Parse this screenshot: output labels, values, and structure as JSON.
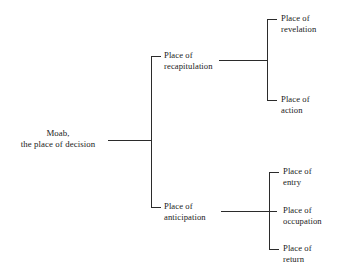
{
  "diagram": {
    "type": "tree-bracket-diagram",
    "orientation": "left-to-right",
    "line_color": "#2b2b2b",
    "background_color": "#ffffff",
    "text_color": "#1a1a1a",
    "root": {
      "id": "root",
      "line1": "Moab,",
      "line2": "the place of decision"
    },
    "branches": [
      {
        "id": "recapitulation",
        "line1": "Place of",
        "line2": "recapitulation",
        "children": [
          {
            "id": "revelation",
            "line1": "Place of",
            "line2": "revelation"
          },
          {
            "id": "action",
            "line1": "Place of",
            "line2": "action"
          }
        ]
      },
      {
        "id": "anticipation",
        "line1": "Place of",
        "line2": "anticipation",
        "children": [
          {
            "id": "entry",
            "line1": "Place of",
            "line2": "entry"
          },
          {
            "id": "occupation",
            "line1": "Place of",
            "line2": "occupation"
          },
          {
            "id": "return",
            "line1": "Place of",
            "line2": "return"
          }
        ]
      }
    ]
  }
}
